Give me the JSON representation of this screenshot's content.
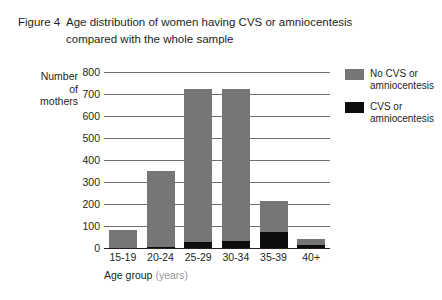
{
  "figure": {
    "number_label": "Figure 4",
    "caption_line1": "Age distribution of women having CVS or amniocentesis",
    "caption_line2": "compared with the whole sample"
  },
  "axes": {
    "y_title_line1": "Number",
    "y_title_line2": "of",
    "y_title_line3": "mothers",
    "x_title_main": "Age group",
    "x_title_units": "(years)"
  },
  "legend": {
    "items": [
      {
        "label_line1": "No CVS or",
        "label_line2": "amniocentesis",
        "color": "#767676",
        "swatch_name": "legend-swatch-no-cvs"
      },
      {
        "label_line1": "CVS or",
        "label_line2": "amniocentesis",
        "color": "#0d0d0d",
        "swatch_name": "legend-swatch-cvs"
      }
    ]
  },
  "colors": {
    "no_cvs": "#767676",
    "cvs": "#0d0d0d",
    "axis": "#231f20",
    "gridline": "#6f6f6f",
    "background": "#ffffff",
    "units_text": "#9a9a9a"
  },
  "chart_data": {
    "type": "bar",
    "subtype": "stacked-vertical",
    "title": "Age distribution of women having CVS or amniocentesis compared with the whole sample",
    "xlabel": "Age group (years)",
    "ylabel": "Number of mothers",
    "ylim": [
      0,
      800
    ],
    "ytick_values": [
      0,
      100,
      200,
      300,
      400,
      500,
      600,
      700,
      800
    ],
    "ytick_labels": [
      "0",
      "100",
      "200",
      "300",
      "400",
      "500",
      "600",
      "700",
      "800"
    ],
    "grid": true,
    "grid_axis": "y",
    "legend_position": "right-top",
    "categories": [
      "15-19",
      "20-24",
      "25-29",
      "30-34",
      "35-39",
      "40+"
    ],
    "series": [
      {
        "name": "CVS or amniocentesis",
        "color": "#0d0d0d",
        "values": [
          0,
          5,
          28,
          30,
          75,
          15
        ]
      },
      {
        "name": "No CVS or amniocentesis",
        "color": "#767676",
        "values": [
          80,
          345,
          697,
          692,
          140,
          27
        ]
      }
    ],
    "totals": [
      80,
      350,
      725,
      722,
      215,
      42
    ]
  }
}
